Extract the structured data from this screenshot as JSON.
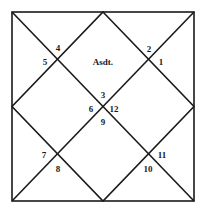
{
  "chart": {
    "type": "north-indian-horoscope",
    "center_label": "Asdt.",
    "houses": [
      {
        "id": "h1",
        "label": "1",
        "x": 161,
        "y": 65
      },
      {
        "id": "h2",
        "label": "2",
        "x": 149,
        "y": 52
      },
      {
        "id": "h3",
        "label": "3",
        "x": 103,
        "y": 98
      },
      {
        "id": "h4",
        "label": "4",
        "x": 58,
        "y": 51
      },
      {
        "id": "h5",
        "label": "5",
        "x": 45,
        "y": 65
      },
      {
        "id": "h6",
        "label": "6",
        "x": 91,
        "y": 112
      },
      {
        "id": "h7",
        "label": "7",
        "x": 44,
        "y": 158
      },
      {
        "id": "h8",
        "label": "8",
        "x": 58,
        "y": 172
      },
      {
        "id": "h9",
        "label": "9",
        "x": 103,
        "y": 125
      },
      {
        "id": "h10",
        "label": "10",
        "x": 148,
        "y": 172
      },
      {
        "id": "h11",
        "label": "11",
        "x": 162,
        "y": 158
      },
      {
        "id": "h12",
        "label": "12",
        "x": 114,
        "y": 112
      }
    ],
    "line_color": "#1a1a1a"
  }
}
